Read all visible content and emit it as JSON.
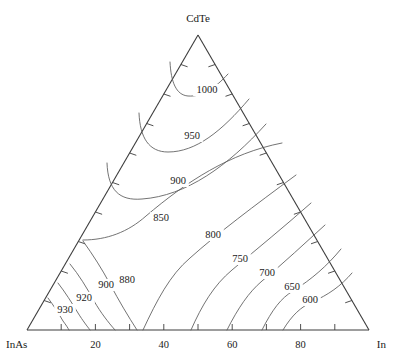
{
  "figure": {
    "type": "ternary-contour-diagram",
    "background_color": "#ffffff",
    "line_color": "#5a5a5a",
    "axis_color": "#3c3c3c",
    "text_color": "#1a1a1a"
  },
  "vertices": {
    "top": "CdTe",
    "bottom_left": "InAs",
    "bottom_right": "In"
  },
  "axis": {
    "tick_labels": [
      "20",
      "40",
      "60",
      "80"
    ],
    "tick_values": [
      20,
      40,
      60,
      80
    ],
    "minor_tick_step": 10
  },
  "chart_data": {
    "type": "contour",
    "title": "",
    "xlabel": "",
    "ylabel": "",
    "components": [
      "CdTe",
      "InAs",
      "In"
    ],
    "quantity": "liquidus temperature",
    "units": "degrees C",
    "levels": [
      1000,
      950,
      900,
      850,
      800,
      750,
      700,
      650,
      600,
      880,
      900,
      920,
      930
    ],
    "contours": [
      {
        "level": 1000,
        "label": "1000",
        "label_x": 207,
        "label_y": 93,
        "path": "M 170 62 C 171 82, 176 95, 188 96 C 203 97, 215 88, 228 74"
      },
      {
        "level": 950,
        "label": "950",
        "label_x": 192,
        "label_y": 139,
        "path": "M 139 113 C 140 138, 149 152, 168 152 C 196 152, 222 131, 249 99"
      },
      {
        "level": 900,
        "label": "900",
        "label_x": 178,
        "label_y": 184,
        "path": "M 107 163 C 108 190, 119 201, 142 199 C 186 196, 228 166, 266 124"
      },
      {
        "level": 850,
        "label": "850",
        "label_x": 161,
        "label_y": 221,
        "path": "M 83 240 C 107 240, 128 232, 146 216 C 186 182, 230 153, 282 143"
      },
      {
        "level": 800,
        "label": "800",
        "label_x": 213,
        "label_y": 238,
        "path": "M 143 330 C 157 300, 170 275, 190 258 C 218 233, 254 206, 296 175"
      },
      {
        "level": 750,
        "label": "750",
        "label_x": 240,
        "label_y": 262,
        "path": "M 191 330 C 202 305, 214 285, 232 270 C 258 248, 284 227, 311 203"
      },
      {
        "level": 700,
        "label": "700",
        "label_x": 267,
        "label_y": 276,
        "path": "M 227 330 C 238 308, 249 292, 262 281 C 285 262, 305 243, 325 225"
      },
      {
        "level": 650,
        "label": "650",
        "label_x": 292,
        "label_y": 290,
        "path": "M 262 330 C 272 310, 281 298, 293 291 C 312 279, 327 266, 341 249"
      },
      {
        "level": 600,
        "label": "600",
        "label_x": 310,
        "label_y": 303,
        "path": "M 283 330 C 292 315, 301 307, 312 302 C 328 295, 341 286, 352 273"
      },
      {
        "level": 880,
        "label": "880",
        "label_x": 127,
        "label_y": 283,
        "path": "M 83 241 C 93 255, 102 269, 110 284 C 119 301, 128 316, 137 330"
      },
      {
        "level": 900,
        "label": "900",
        "label_x": 106,
        "label_y": 288,
        "path": "M 70 264 C 79 275, 87 288, 94 301 C 101 313, 108 322, 115 330"
      },
      {
        "level": 920,
        "label": "920",
        "label_x": 84,
        "label_y": 301,
        "path": "M 58 283 C 65 292, 72 303, 78 313 C 83 321, 87 326, 90 330"
      },
      {
        "level": 930,
        "label": "930",
        "label_x": 65,
        "label_y": 313,
        "path": "M 48 298 C 54 306, 59 314, 63 321 C 66 325, 68 328, 69 330"
      }
    ],
    "axis_ranges": {
      "min": 0,
      "max": 100
    },
    "grid": false,
    "legend": "none"
  }
}
